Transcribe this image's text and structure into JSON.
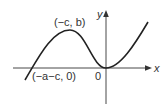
{
  "diagram": {
    "type": "function-graph",
    "axes": {
      "x_label": "x",
      "y_label": "y",
      "origin_label": "0"
    },
    "points": [
      {
        "label": "(−c, b)",
        "role": "local-maximum"
      },
      {
        "label": "(−a−c, 0)",
        "role": "x-intercept"
      }
    ],
    "colors": {
      "curve": "#222222",
      "axes": "#333333",
      "background": "#ffffff"
    }
  }
}
